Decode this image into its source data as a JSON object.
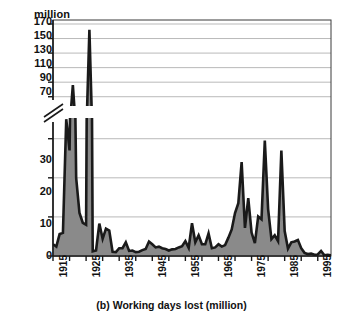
{
  "chart_data": {
    "type": "area",
    "title": "",
    "caption": "(b) Working days lost (million)",
    "unit_label": "million",
    "xlabel": "",
    "ylabel": "million",
    "grid": true,
    "legend": "none",
    "broken_axis": true,
    "axis_break_between": [
      35,
      60
    ],
    "xlim": [
      1915,
      1999
    ],
    "ylim": [
      0,
      170
    ],
    "y_ticks_lower": [
      0,
      10,
      20,
      30
    ],
    "y_ticks_upper": [
      70,
      90,
      110,
      130,
      150,
      170
    ],
    "x_ticks": [
      1915,
      1925,
      1935,
      1945,
      1955,
      1965,
      1975,
      1985,
      1995
    ],
    "x_tick_labels": [
      "1915",
      "1925",
      "1935",
      "1945",
      "1955",
      "1965",
      "1975",
      "1985",
      "1995"
    ],
    "y_tick_labels_upper": [
      "170",
      "150",
      "130",
      "110",
      "90",
      "70"
    ],
    "y_tick_labels_lower": [
      "30",
      "20",
      "10",
      "0"
    ],
    "series_name": "Working days lost (million)",
    "fill_color": "#8a8a8a",
    "line_color": "#1a1a1a",
    "x": [
      1915,
      1916,
      1917,
      1918,
      1919,
      1920,
      1921,
      1922,
      1923,
      1924,
      1925,
      1926,
      1927,
      1928,
      1929,
      1930,
      1931,
      1932,
      1933,
      1934,
      1935,
      1936,
      1937,
      1938,
      1939,
      1940,
      1941,
      1942,
      1943,
      1944,
      1945,
      1946,
      1947,
      1948,
      1949,
      1950,
      1951,
      1952,
      1953,
      1954,
      1955,
      1956,
      1957,
      1958,
      1959,
      1960,
      1961,
      1962,
      1963,
      1964,
      1965,
      1966,
      1967,
      1968,
      1969,
      1970,
      1971,
      1972,
      1973,
      1974,
      1975,
      1976,
      1977,
      1978,
      1979,
      1980,
      1981,
      1982,
      1983,
      1984,
      1985,
      1986,
      1987,
      1988,
      1989,
      1990,
      1991,
      1992,
      1993,
      1994,
      1995,
      1996,
      1997,
      1998,
      1999
    ],
    "values": [
      3.0,
      2.4,
      5.6,
      5.9,
      35.0,
      27.0,
      86.0,
      20.0,
      11.0,
      8.5,
      8.0,
      162.0,
      1.2,
      1.4,
      8.3,
      4.4,
      7.0,
      6.5,
      1.1,
      1.0,
      2.0,
      2.0,
      3.5,
      1.3,
      1.4,
      1.0,
      1.1,
      1.5,
      1.8,
      3.7,
      3.0,
      2.2,
      2.4,
      2.0,
      1.8,
      1.4,
      1.7,
      1.8,
      2.2,
      2.5,
      3.8,
      2.1,
      8.4,
      3.5,
      5.3,
      3.0,
      3.0,
      5.8,
      2.0,
      2.2,
      3.0,
      2.4,
      2.8,
      4.7,
      6.8,
      11.0,
      13.5,
      24.0,
      7.2,
      14.8,
      6.0,
      3.3,
      10.1,
      9.4,
      29.5,
      12.0,
      4.3,
      5.3,
      3.8,
      27.0,
      6.4,
      1.9,
      3.5,
      3.7,
      4.1,
      2.0,
      0.8,
      0.5,
      0.6,
      0.3,
      0.4,
      1.3,
      0.2,
      0.3,
      0.2
    ]
  },
  "axis": {
    "unit_label": "million",
    "caption": "(b) Working days lost (million)"
  }
}
